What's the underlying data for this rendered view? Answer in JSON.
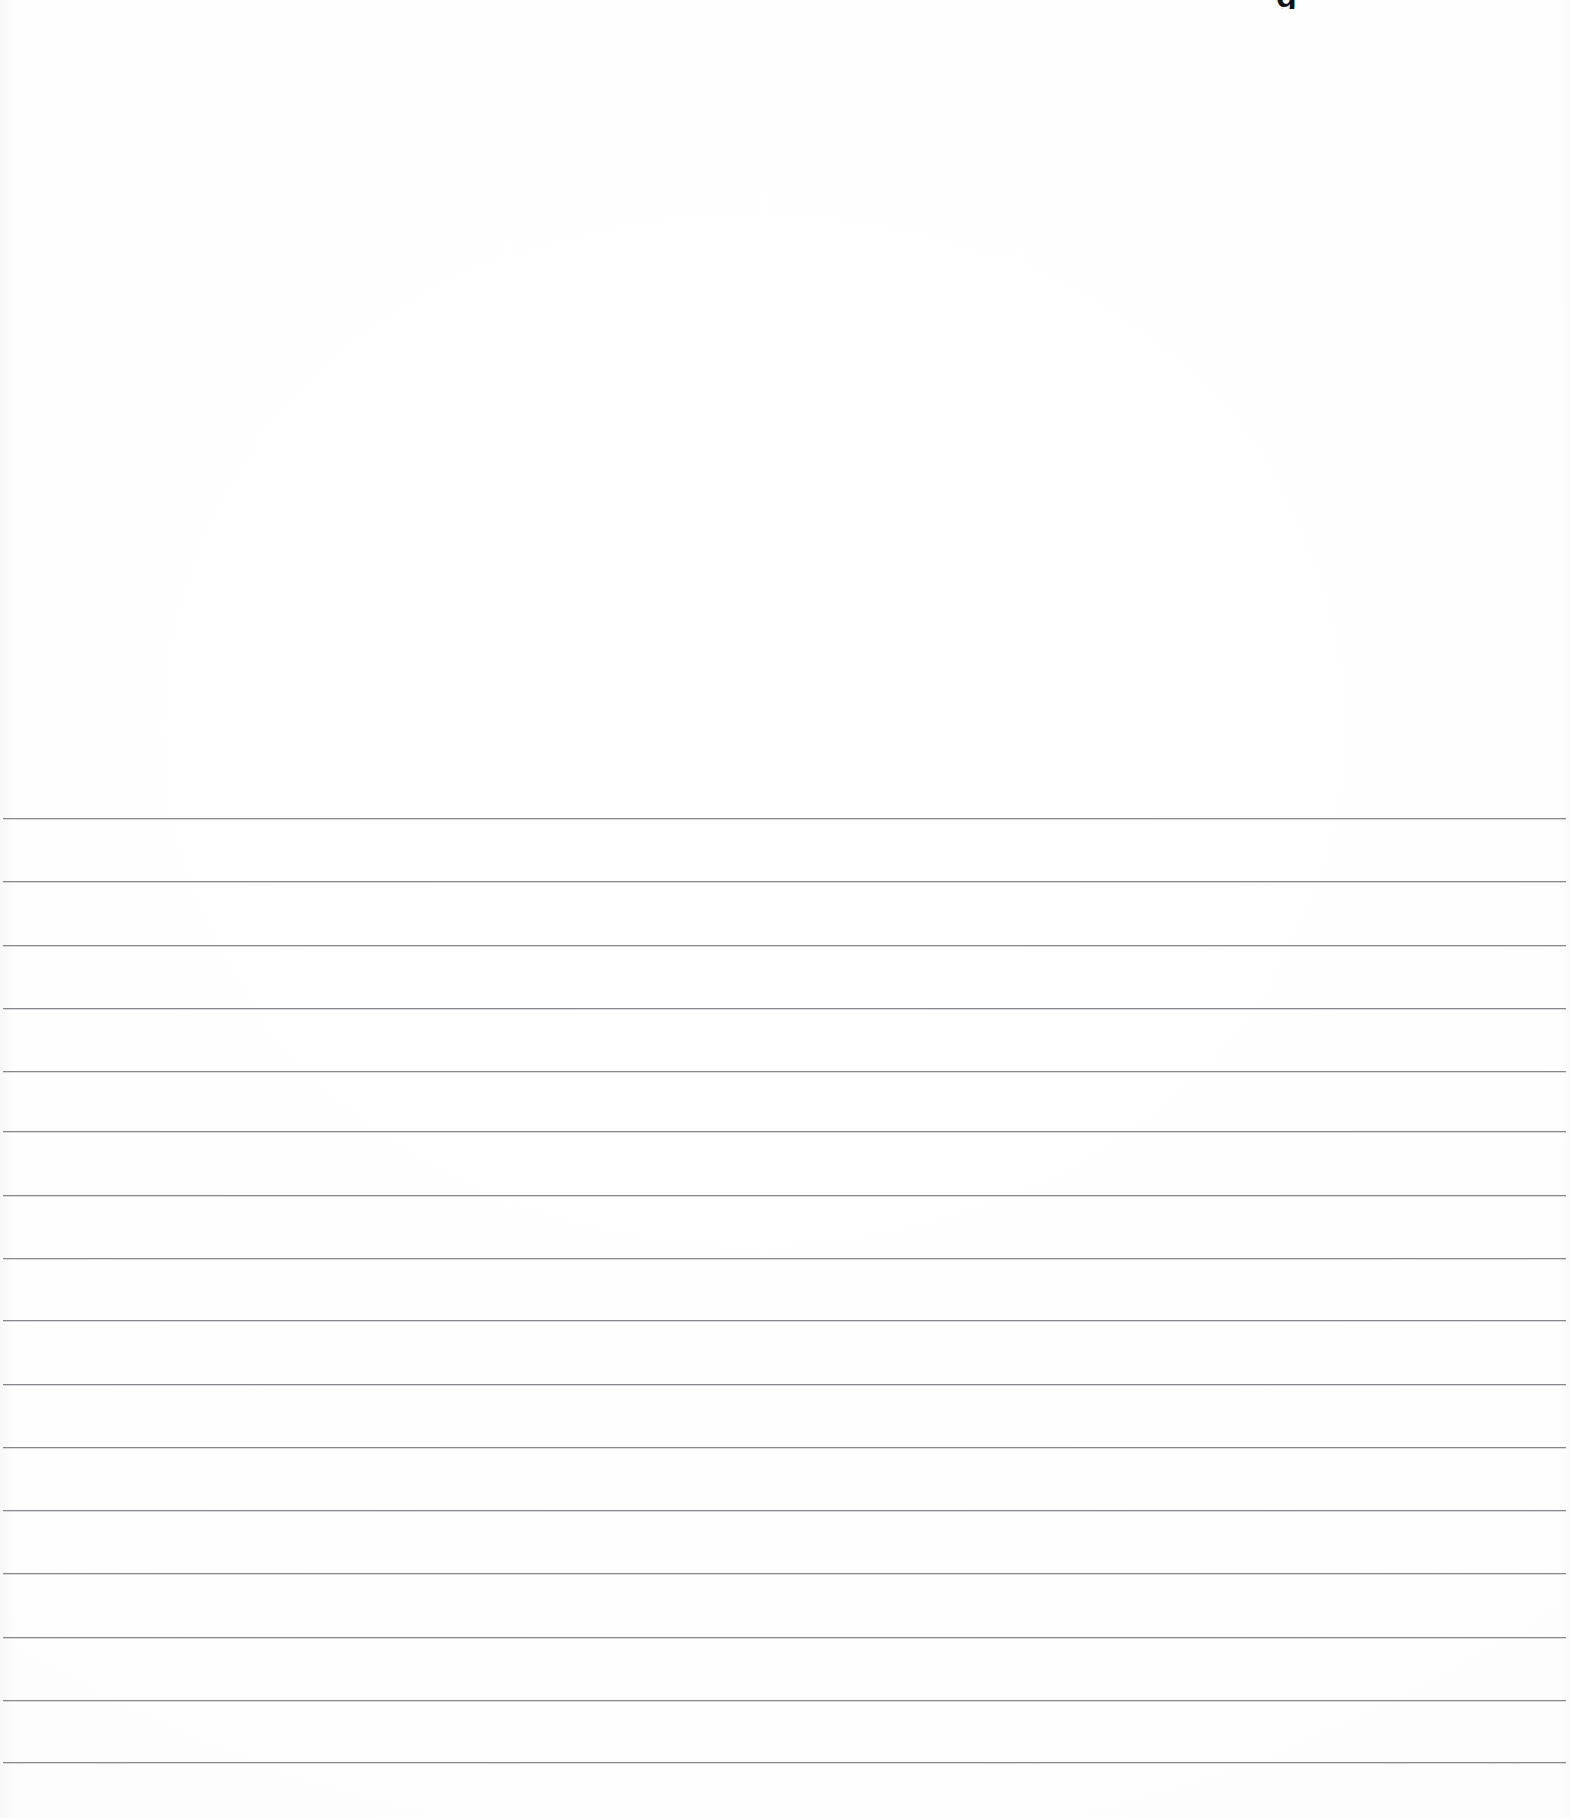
{
  "document": {
    "kind": "scanned-ruled-paper",
    "title": "Blank ruled notebook paper",
    "page_width": 1570,
    "page_height": 1818,
    "background_color": "#ffffff",
    "body_text": "",
    "has_handwriting": false,
    "is_blank": true
  },
  "artifacts": {
    "top_glyph": {
      "name": "cropped-glyph-fragment",
      "text": "g",
      "description": "bottom tip of a dark bold character clipped by the top edge of the scan",
      "color": "#121212",
      "x": 1276,
      "y": 0,
      "width": 26,
      "height": 9
    }
  },
  "blank_area": {
    "name": "unruled-upper-margin",
    "x": 0,
    "y": 0,
    "width": 1570,
    "height": 818,
    "content": ""
  },
  "ruling": {
    "name": "horizontal-rule-set",
    "line_color": "#7b7e83",
    "line_thickness": 1,
    "line_spacing": 63,
    "left_x": 3,
    "right_x": 1566,
    "first_line_y": 818,
    "last_line_y": 1762,
    "count": 16,
    "lines": [
      {
        "index": 1,
        "y": 818,
        "left": 3,
        "right": 1566
      },
      {
        "index": 2,
        "y": 881,
        "left": 3,
        "right": 1566
      },
      {
        "index": 3,
        "y": 945,
        "left": 3,
        "right": 1566
      },
      {
        "index": 4,
        "y": 1008,
        "left": 3,
        "right": 1566
      },
      {
        "index": 5,
        "y": 1071,
        "left": 3,
        "right": 1566
      },
      {
        "index": 6,
        "y": 1131,
        "left": 3,
        "right": 1566
      },
      {
        "index": 7,
        "y": 1195,
        "left": 3,
        "right": 1566
      },
      {
        "index": 8,
        "y": 1258,
        "left": 3,
        "right": 1566
      },
      {
        "index": 9,
        "y": 1320,
        "left": 3,
        "right": 1566
      },
      {
        "index": 10,
        "y": 1384,
        "left": 3,
        "right": 1566
      },
      {
        "index": 11,
        "y": 1447,
        "left": 3,
        "right": 1566
      },
      {
        "index": 12,
        "y": 1510,
        "left": 3,
        "right": 1566
      },
      {
        "index": 13,
        "y": 1573,
        "left": 3,
        "right": 1566
      },
      {
        "index": 14,
        "y": 1637,
        "left": 3,
        "right": 1566
      },
      {
        "index": 15,
        "y": 1700,
        "left": 3,
        "right": 1566
      },
      {
        "index": 16,
        "y": 1762,
        "left": 3,
        "right": 1566
      }
    ]
  }
}
